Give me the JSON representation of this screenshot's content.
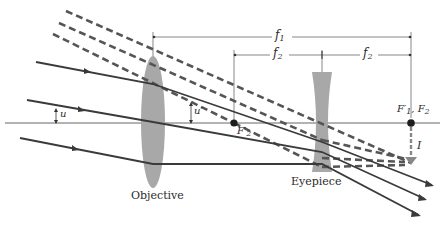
{
  "diagram": {
    "type": "refracting telescope (Galilean) ray diagram",
    "colors": {
      "ray": "#3a3a3a",
      "lens": "#a8a8a8",
      "axis": "#555555",
      "dashed": "#555555",
      "background": "#ffffff"
    },
    "labels": {
      "objective": "Objective",
      "eyepiece": "Eyepiece",
      "f1": "f",
      "f1_sub": "1",
      "f2_left": "f",
      "f2_left_sub": "2",
      "f2_right": "f",
      "f2_right_sub": "2",
      "angle_u": "u",
      "angle_u_prime": "u′",
      "focal_f2_prime": "F′",
      "focal_f2_prime_sub": "2",
      "focal_f1_f2": "F′",
      "focal_f1_sub": "1",
      "focal_f2_sep": ", F",
      "focal_f2_sub": "2",
      "image": "I"
    }
  }
}
